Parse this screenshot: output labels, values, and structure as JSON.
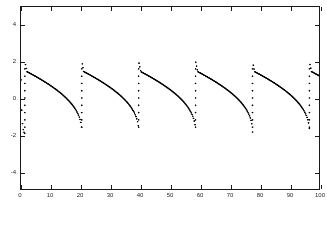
{
  "figure": {
    "background_color": "#ffffff",
    "axis_color": "#1a1a1a",
    "marker_color": "#000000",
    "tick_label_color": "#2a2a2a"
  },
  "chart_data": {
    "type": "scatter",
    "title": "",
    "subtitle": "",
    "xlabel": "",
    "ylabel": "",
    "xlim": [
      0,
      100
    ],
    "ylim": [
      -5,
      5
    ],
    "xticks": [
      0,
      10,
      20,
      30,
      40,
      50,
      60,
      70,
      80,
      90,
      100
    ],
    "xtick_labels": [
      "0",
      "10",
      "20",
      "30",
      "40",
      "50",
      "60",
      "70",
      "80",
      "90",
      "100"
    ],
    "yticks": [
      -4,
      -2,
      0,
      2,
      4
    ],
    "ytick_labels": [
      "-4",
      "-2",
      "0",
      "2",
      "4"
    ],
    "grid": false,
    "legend": [],
    "legend_position": "none",
    "marker": "dot",
    "marker_size_px": 1.7,
    "series": [
      {
        "name": "relaxation oscillation",
        "description": "Van der Pol style relaxation oscillator sampled at uniform steps; slow decay toward -2 followed by fast vertical jump to +2.",
        "period": 19.1,
        "amplitude_high": 2.0,
        "amplitude_low": -2.0,
        "initial_value": 1.0,
        "n_points": 400,
        "jump_times": [
          1.3,
          20.4,
          39.5,
          58.6,
          77.7,
          96.8
        ],
        "x": [],
        "y": []
      }
    ]
  }
}
